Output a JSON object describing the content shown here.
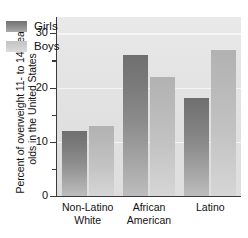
{
  "chart_data": {
    "type": "bar",
    "title": "",
    "subtitle": "",
    "xlabel": "",
    "ylabel_lines": [
      "Percent of overweight 11- to 14-year-",
      "olds in the United States"
    ],
    "ylabel": "Percent of overweight 11- to 14-year-olds in the United States",
    "categories": [
      "Non-Latino White",
      "African American",
      "Latino"
    ],
    "category_lines": [
      [
        "Non-Latino",
        "White"
      ],
      [
        "African",
        "American"
      ],
      [
        "Latino",
        ""
      ]
    ],
    "series": [
      {
        "name": "Girls",
        "color": "#8c8c8c",
        "values": [
          12,
          26,
          18
        ]
      },
      {
        "name": "Boys",
        "color": "#c6c6c6",
        "values": [
          13,
          22,
          27
        ]
      }
    ],
    "ylim": [
      0,
      33
    ],
    "ymajor_ticks": [
      0,
      10,
      20,
      30
    ],
    "yminor_ticks": [
      5,
      15,
      25
    ],
    "ytick_labels": [
      "0",
      "10",
      "20",
      "30"
    ],
    "grid": true,
    "gridlines_at": [
      10,
      20,
      30
    ],
    "legend_position": "upper-left-inside",
    "plot_background": "#e4e4e4",
    "axis_color": "#3b3b3b",
    "text_color": "#111111"
  }
}
